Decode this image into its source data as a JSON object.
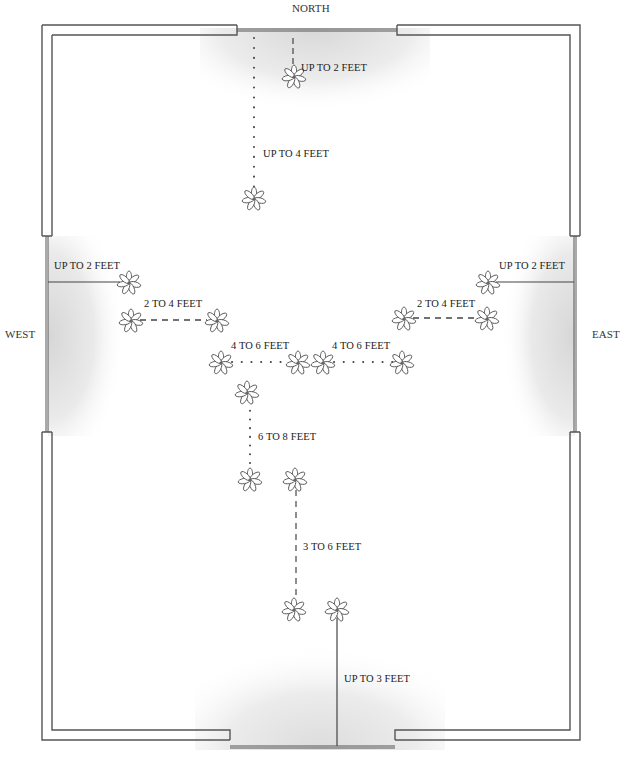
{
  "diagram": {
    "type": "floor-plan",
    "compass": {
      "north": "NORTH",
      "south": "",
      "west": "WEST",
      "east": "EAST"
    },
    "colors": {
      "wall": "#555555",
      "line": "#444444",
      "light_shade": "#e6e6e6",
      "text": "#222222"
    },
    "zones": [
      {
        "id": "north-near",
        "label": "UP TO 2 FEET",
        "line_style": "dashed",
        "from_window": "north"
      },
      {
        "id": "north-far",
        "label": "UP TO 4 FEET",
        "line_style": "dotted",
        "from_window": "north"
      },
      {
        "id": "west-near",
        "label": "UP TO 2 FEET",
        "line_style": "solid",
        "from_window": "west"
      },
      {
        "id": "west-mid",
        "label": "2 TO 4 FEET",
        "line_style": "dashed",
        "from_window": "west"
      },
      {
        "id": "west-far",
        "label": "4 TO 6 FEET",
        "line_style": "dotted",
        "from_window": "west"
      },
      {
        "id": "east-near",
        "label": "UP TO 2 FEET",
        "line_style": "solid",
        "from_window": "east"
      },
      {
        "id": "east-mid",
        "label": "2 TO 4 FEET",
        "line_style": "dashed",
        "from_window": "east"
      },
      {
        "id": "east-far",
        "label": "4 TO 6 FEET",
        "line_style": "dotted",
        "from_window": "east"
      },
      {
        "id": "center",
        "label": "6 TO 8 FEET",
        "line_style": "dotted",
        "from_window": "interior"
      },
      {
        "id": "south-mid",
        "label": "3 TO 6 FEET",
        "line_style": "dashed",
        "from_window": "south"
      },
      {
        "id": "south-near",
        "label": "UP TO 3 FEET",
        "line_style": "solid",
        "from_window": "south"
      }
    ],
    "plant_count": 16
  }
}
